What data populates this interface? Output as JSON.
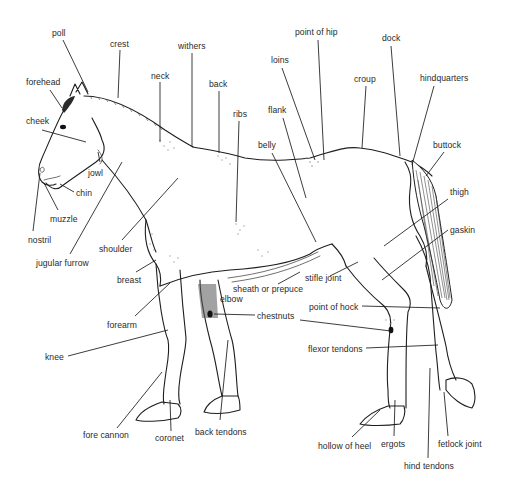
{
  "diagram": {
    "type": "labeled anatomical line illustration",
    "text_color": "#2a2a2a",
    "line_color": "#1a1a1a",
    "background": "#ffffff",
    "labels": [
      {
        "id": "poll",
        "text": "poll",
        "x": 52,
        "y": 28
      },
      {
        "id": "crest",
        "text": "crest",
        "x": 110,
        "y": 39
      },
      {
        "id": "withers",
        "text": "withers",
        "x": 178,
        "y": 41
      },
      {
        "id": "neck",
        "text": "neck",
        "x": 151,
        "y": 71
      },
      {
        "id": "back",
        "text": "back",
        "x": 209,
        "y": 79
      },
      {
        "id": "ribs",
        "text": "ribs",
        "x": 233,
        "y": 109
      },
      {
        "id": "forehead",
        "text": "forehead",
        "x": 26,
        "y": 77
      },
      {
        "id": "cheek",
        "text": "cheek",
        "x": 26,
        "y": 116
      },
      {
        "id": "point-of-hip",
        "text": "point of hip",
        "x": 295,
        "y": 27
      },
      {
        "id": "dock",
        "text": "dock",
        "x": 382,
        "y": 33
      },
      {
        "id": "loins",
        "text": "loins",
        "x": 271,
        "y": 55
      },
      {
        "id": "croup",
        "text": "croup",
        "x": 354,
        "y": 74
      },
      {
        "id": "hindquarters",
        "text": "hindquarters",
        "x": 420,
        "y": 73
      },
      {
        "id": "flank",
        "text": "flank",
        "x": 268,
        "y": 105
      },
      {
        "id": "belly",
        "text": "belly",
        "x": 258,
        "y": 140
      },
      {
        "id": "buttock",
        "text": "buttock",
        "x": 433,
        "y": 140
      },
      {
        "id": "jowl",
        "text": "jowl",
        "x": 88,
        "y": 168
      },
      {
        "id": "chin",
        "text": "chin",
        "x": 76,
        "y": 188
      },
      {
        "id": "muzzle",
        "text": "muzzle",
        "x": 50,
        "y": 214
      },
      {
        "id": "nostril",
        "text": "nostril",
        "x": 28,
        "y": 235
      },
      {
        "id": "shoulder",
        "text": "shoulder",
        "x": 99,
        "y": 244
      },
      {
        "id": "jugular-furrow",
        "text": "jugular furrow",
        "x": 36,
        "y": 258
      },
      {
        "id": "breast",
        "text": "breast",
        "x": 117,
        "y": 275
      },
      {
        "id": "thigh",
        "text": "thigh",
        "x": 450,
        "y": 187
      },
      {
        "id": "gaskin",
        "text": "gaskin",
        "x": 450,
        "y": 225
      },
      {
        "id": "stifle-joint",
        "text": "stifle joint",
        "x": 305,
        "y": 273
      },
      {
        "id": "sheath-or-prepuce",
        "text": "sheath or prepuce",
        "x": 233,
        "y": 284
      },
      {
        "id": "elbow",
        "text": "elbow",
        "x": 220,
        "y": 294
      },
      {
        "id": "forearm",
        "text": "forearm",
        "x": 107,
        "y": 320
      },
      {
        "id": "chestnuts",
        "text": "chestnuts",
        "x": 257,
        "y": 311
      },
      {
        "id": "point-of-hock",
        "text": "point of hock",
        "x": 309,
        "y": 302
      },
      {
        "id": "flexor-tendons",
        "text": "flexor tendons",
        "x": 308,
        "y": 344
      },
      {
        "id": "knee",
        "text": "knee",
        "x": 45,
        "y": 352
      },
      {
        "id": "fore-cannon",
        "text": "fore cannon",
        "x": 83,
        "y": 430
      },
      {
        "id": "coronet",
        "text": "coronet",
        "x": 155,
        "y": 433
      },
      {
        "id": "back-tendons",
        "text": "back tendons",
        "x": 195,
        "y": 427
      },
      {
        "id": "hollow-of-heel",
        "text": "hollow of heel",
        "x": 318,
        "y": 441
      },
      {
        "id": "ergots",
        "text": "ergots",
        "x": 381,
        "y": 439
      },
      {
        "id": "fetlock-joint",
        "text": "fetlock joint",
        "x": 438,
        "y": 439
      },
      {
        "id": "hind-tendons",
        "text": "hind tendons",
        "x": 404,
        "y": 461
      }
    ]
  }
}
